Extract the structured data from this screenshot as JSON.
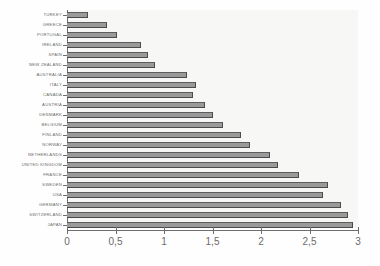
{
  "chart_data": {
    "type": "bar",
    "orientation": "horizontal",
    "title": "",
    "subtitle": "",
    "xlabel": "",
    "ylabel": "",
    "xlim": [
      0,
      3
    ],
    "grid": false,
    "legend": null,
    "decimal_separator": ",",
    "xticks": [
      "0",
      "0,5",
      "1",
      "1,5",
      "2",
      "2,5",
      "3"
    ],
    "xtick_values": [
      0,
      0.5,
      1,
      1.5,
      2,
      2.5,
      3
    ],
    "categories": [
      "TURKEY",
      "GREECE",
      "PORTUGAL",
      "IRELAND",
      "SPAIN",
      "NEW ZEALAND",
      "AUSTRALIA",
      "ITALY",
      "CANADA",
      "AUSTRIA",
      "DENMARK",
      "BELGIUM",
      "FINLAND",
      "NORWAY",
      "NETHERLANDS",
      "UNITED KINGDOM",
      "FRANCE",
      "SWEDEN",
      "USA",
      "GERMANY",
      "SWITZERLAND",
      "JAPAN"
    ],
    "values": [
      0.22,
      0.41,
      0.52,
      0.76,
      0.84,
      0.91,
      1.24,
      1.33,
      1.3,
      1.42,
      1.51,
      1.61,
      1.79,
      1.89,
      2.09,
      2.18,
      2.39,
      2.69,
      2.64,
      2.82,
      2.9,
      2.95
    ],
    "colors": {
      "bar_fill": "#9a9a9a",
      "bar_edge": "#4a4a4a",
      "plot_background": "#f7f7f5",
      "axis": "#6e6e6e",
      "text": "#6b6b6b",
      "page_background": "#fefefe"
    }
  }
}
